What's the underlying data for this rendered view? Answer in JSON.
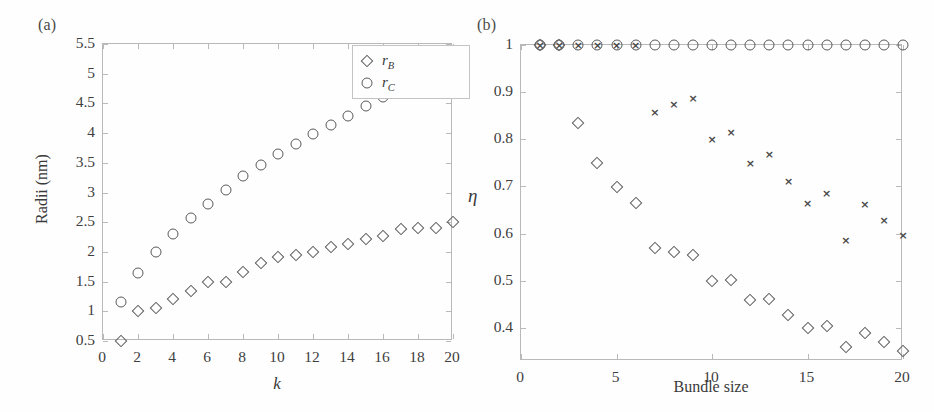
{
  "figure": {
    "panels": [
      {
        "id": "a",
        "label": "(a)",
        "xlabel": "k",
        "ylabel": "Radii (nm)"
      },
      {
        "id": "b",
        "label": "(b)",
        "xlabel": "Bundle size",
        "ylabel": "η"
      }
    ]
  },
  "legend_a": {
    "entries": [
      {
        "marker": "diamond",
        "label": "r",
        "sub": "B"
      },
      {
        "marker": "circle",
        "label": "r",
        "sub": "C"
      }
    ]
  },
  "chart_data": [
    {
      "type": "scatter",
      "panel": "(a)",
      "title": "",
      "xlabel": "k",
      "ylabel": "Radii (nm)",
      "xlim": [
        0,
        20
      ],
      "ylim": [
        0.5,
        5.5
      ],
      "xticks": [
        0,
        2,
        4,
        6,
        8,
        10,
        12,
        14,
        16,
        18,
        20
      ],
      "xticklabels": [
        "0",
        "2",
        "4",
        "6",
        "8",
        "10",
        "12",
        "14",
        "16",
        "18",
        "20"
      ],
      "yticks": [
        0.5,
        1,
        1.5,
        2,
        2.5,
        3,
        3.5,
        4,
        4.5,
        5,
        5.5
      ],
      "yticklabels": [
        "0.5",
        "1",
        "1.5",
        "2",
        "2.5",
        "3",
        "3.5",
        "4",
        "4.5",
        "5",
        "5.5"
      ],
      "grid": false,
      "legend_position": "upper right",
      "x": [
        1,
        2,
        3,
        4,
        5,
        6,
        7,
        8,
        9,
        10,
        11,
        12,
        13,
        14,
        15,
        16,
        17,
        18,
        19,
        20
      ],
      "series": [
        {
          "name": "r_B",
          "marker": "diamond",
          "values": [
            0.5,
            1.0,
            1.06,
            1.2,
            1.35,
            1.5,
            1.5,
            1.66,
            1.81,
            1.91,
            1.95,
            2.0,
            2.09,
            2.14,
            2.22,
            2.27,
            2.38,
            2.4,
            2.41,
            2.5
          ]
        },
        {
          "name": "r_C",
          "marker": "circle",
          "values": [
            1.15,
            1.65,
            2.0,
            2.3,
            2.57,
            2.81,
            3.05,
            3.28,
            3.47,
            3.64,
            3.81,
            3.99,
            4.14,
            4.29,
            4.45,
            4.61,
            4.73,
            4.9,
            5.05,
            5.2
          ]
        }
      ]
    },
    {
      "type": "scatter",
      "panel": "(b)",
      "title": "",
      "xlabel": "Bundle size",
      "ylabel": "η",
      "xlim": [
        0,
        20
      ],
      "ylim": [
        0.33,
        1.0
      ],
      "xticks": [
        0,
        5,
        10,
        15,
        20
      ],
      "xticklabels": [
        "0",
        "5",
        "10",
        "15",
        "20"
      ],
      "yticks": [
        0.4,
        0.5,
        0.6,
        0.7,
        0.8,
        0.9,
        1
      ],
      "yticklabels": [
        "0.4",
        "0.5",
        "0.6",
        "0.7",
        "0.8",
        "0.9",
        "1"
      ],
      "grid": false,
      "legend_position": "none",
      "x": [
        1,
        2,
        3,
        4,
        5,
        6,
        7,
        8,
        9,
        10,
        11,
        12,
        13,
        14,
        15,
        16,
        17,
        18,
        19,
        20
      ],
      "series": [
        {
          "name": "circles",
          "marker": "circle",
          "values": [
            1,
            1,
            1,
            1,
            1,
            1,
            1,
            1,
            1,
            1,
            1,
            1,
            1,
            1,
            1,
            1,
            1,
            1,
            1,
            1
          ]
        },
        {
          "name": "crosses",
          "marker": "cross",
          "values": [
            1.0,
            1.0,
            1.0,
            1.0,
            1.0,
            1.0,
            0.857,
            0.875,
            0.887,
            0.8,
            0.816,
            0.75,
            0.768,
            0.712,
            0.665,
            0.687,
            0.587,
            0.663,
            0.628,
            0.597
          ]
        },
        {
          "name": "diamonds",
          "marker": "diamond",
          "values": [
            1.0,
            1.0,
            0.835,
            0.75,
            0.699,
            0.665,
            0.57,
            0.561,
            0.555,
            0.5,
            0.501,
            0.459,
            0.462,
            0.428,
            0.399,
            0.405,
            0.359,
            0.39,
            0.371,
            0.352
          ]
        }
      ]
    }
  ],
  "style": {
    "marker_stroke": "#5a5a5a",
    "axis_color": "#b9b9b9",
    "text_color": "#3a3a3a",
    "background": "#fefefe"
  }
}
